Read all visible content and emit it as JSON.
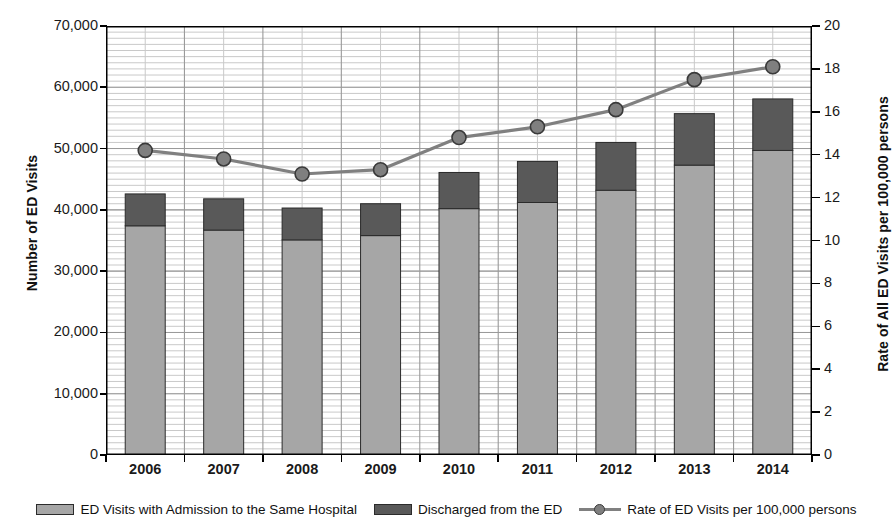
{
  "chart_data": {
    "type": "bar",
    "title": "",
    "subtitle": "",
    "categories": [
      "2006",
      "2007",
      "2008",
      "2009",
      "2010",
      "2011",
      "2012",
      "2013",
      "2014"
    ],
    "xlabel": "",
    "ylabel": "Number of ED Visits",
    "y2label": "Rate of All ED Visits per 100,000 persons",
    "ylim": [
      0,
      70000
    ],
    "y2lim": [
      0,
      20
    ],
    "yticks": [
      0,
      10000,
      20000,
      30000,
      40000,
      50000,
      60000,
      70000
    ],
    "ytick_labels": [
      "0",
      "10,000",
      "20,000",
      "30,000",
      "40,000",
      "50,000",
      "60,000",
      "70,000"
    ],
    "y2ticks": [
      0,
      2,
      4,
      6,
      8,
      10,
      12,
      14,
      16,
      18,
      20
    ],
    "y2tick_labels": [
      "0",
      "2",
      "4",
      "6",
      "8",
      "10",
      "12",
      "14",
      "16",
      "18",
      "20"
    ],
    "grid": "horizontal-minor-and-major, vertical-major",
    "stacked": true,
    "legend_position": "bottom",
    "series": [
      {
        "name": "ED Visits with Admission to the Same Hospital",
        "kind": "bar-stack-bottom",
        "axis": "left",
        "color": "#a6a6a6",
        "values": [
          37400,
          36700,
          35100,
          35800,
          40200,
          41200,
          43200,
          47300,
          49700
        ]
      },
      {
        "name": "Discharged from the ED",
        "kind": "bar-stack-top",
        "axis": "left",
        "color": "#595959",
        "values": [
          5200,
          5100,
          5200,
          5200,
          5900,
          6700,
          7800,
          8400,
          8400
        ]
      },
      {
        "name": "Rate of ED Visits per 100,000 persons",
        "kind": "line",
        "axis": "right",
        "color": "#808080",
        "marker": "circle",
        "values": [
          14.2,
          13.8,
          13.1,
          13.3,
          14.8,
          15.3,
          16.1,
          17.5,
          18.1
        ]
      }
    ],
    "totals": [
      42600,
      41800,
      40300,
      41000,
      46100,
      47900,
      51000,
      55700,
      58100
    ]
  },
  "legend": {
    "items": [
      {
        "label": "ED Visits with Admission to the Same Hospital",
        "swatch": "light-gray-square"
      },
      {
        "label": "Discharged from the ED",
        "swatch": "dark-gray-square"
      },
      {
        "label": "Rate of ED Visits per 100,000 persons",
        "swatch": "gray-line-with-circle-marker"
      }
    ]
  },
  "colors": {
    "bar_bottom": "#a6a6a6",
    "bar_top": "#595959",
    "line": "#808080",
    "marker_fill": "#7f7f7f",
    "marker_edge": "#3a3a3a",
    "grid_minor": "#c9c9c9",
    "grid_major": "#9a9a9a",
    "axis": "#000000"
  }
}
